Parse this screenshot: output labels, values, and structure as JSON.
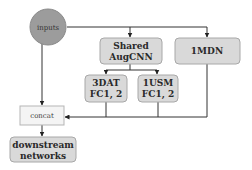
{
  "diagram": {
    "nodes": {
      "inputs": {
        "label": "inputs"
      },
      "shared_augcnn": {
        "line1": "Shared",
        "line2": "AugCNN"
      },
      "mdn": {
        "label": "1MDN"
      },
      "dat": {
        "line1": "3DAT",
        "line2": "FC1, 2"
      },
      "usm": {
        "line1": "1USM",
        "line2": "FC1, 2"
      },
      "concat": {
        "label": "concat"
      },
      "downstream": {
        "line1": "downstream",
        "line2": "networks"
      }
    },
    "edges": [
      {
        "from": "inputs",
        "to": "shared_augcnn"
      },
      {
        "from": "inputs",
        "to": "mdn"
      },
      {
        "from": "inputs",
        "to": "concat"
      },
      {
        "from": "shared_augcnn",
        "to": "dat"
      },
      {
        "from": "shared_augcnn",
        "to": "usm"
      },
      {
        "from": "dat",
        "to": "concat"
      },
      {
        "from": "usm",
        "to": "concat"
      },
      {
        "from": "mdn",
        "to": "concat"
      },
      {
        "from": "concat",
        "to": "downstream"
      }
    ]
  }
}
